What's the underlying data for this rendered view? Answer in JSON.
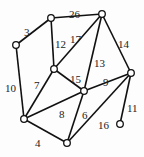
{
  "diagram": {
    "type": "weighted-graph",
    "nodes": [
      {
        "id": "A",
        "x": 51,
        "y": 18
      },
      {
        "id": "B",
        "x": 102,
        "y": 14
      },
      {
        "id": "C",
        "x": 16,
        "y": 45
      },
      {
        "id": "D",
        "x": 54,
        "y": 69
      },
      {
        "id": "E",
        "x": 131,
        "y": 73
      },
      {
        "id": "F",
        "x": 84,
        "y": 91
      },
      {
        "id": "G",
        "x": 24,
        "y": 119
      },
      {
        "id": "H",
        "x": 67,
        "y": 143
      },
      {
        "id": "I",
        "x": 120,
        "y": 124
      }
    ],
    "edges": [
      {
        "from": "A",
        "to": "B",
        "weight": "26",
        "lx": 69,
        "ly": 10
      },
      {
        "from": "A",
        "to": "C",
        "weight": "3",
        "lx": 24,
        "ly": 28
      },
      {
        "from": "A",
        "to": "D",
        "weight": "12",
        "lx": 55,
        "ly": 40
      },
      {
        "from": "B",
        "to": "D",
        "weight": "17",
        "lx": 70,
        "ly": 35
      },
      {
        "from": "B",
        "to": "F",
        "weight": "13",
        "lx": 94,
        "ly": 59
      },
      {
        "from": "B",
        "to": "E",
        "weight": "14",
        "lx": 118,
        "ly": 40
      },
      {
        "from": "C",
        "to": "G",
        "weight": "10",
        "lx": 5,
        "ly": 84
      },
      {
        "from": "D",
        "to": "G",
        "weight": "7",
        "lx": 34,
        "ly": 81
      },
      {
        "from": "D",
        "to": "F",
        "weight": "15",
        "lx": 70,
        "ly": 75
      },
      {
        "from": "G",
        "to": "F",
        "weight": "8",
        "lx": 59,
        "ly": 110
      },
      {
        "from": "F",
        "to": "E",
        "weight": "9",
        "lx": 103,
        "ly": 78
      },
      {
        "from": "F",
        "to": "H",
        "weight": "6",
        "lx": 82,
        "ly": 111
      },
      {
        "from": "E",
        "to": "H",
        "weight": "16",
        "lx": 98,
        "ly": 121
      },
      {
        "from": "G",
        "to": "H",
        "weight": "4",
        "lx": 35,
        "ly": 139
      },
      {
        "from": "E",
        "to": "I",
        "weight": "11",
        "lx": 127,
        "ly": 104
      }
    ]
  }
}
